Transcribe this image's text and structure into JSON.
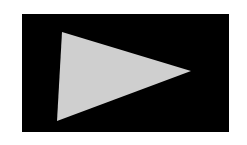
{
  "canvas": {
    "width": 247,
    "height": 145,
    "background": "#ffffff"
  },
  "panel": {
    "color": "#000000"
  },
  "triangle": {
    "icon": "play-triangle",
    "fill": "#cfcfcf",
    "points": "62,32 191,71 57,121"
  }
}
